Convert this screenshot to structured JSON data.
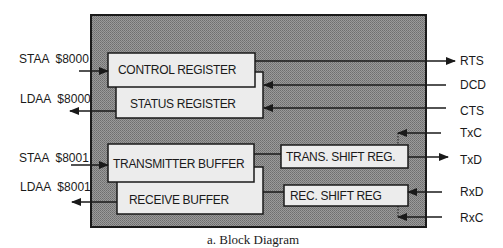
{
  "caption": "a. Block Diagram",
  "colors": {
    "chip_fill": "#8a8a8a",
    "box_fill": "#ececec",
    "line": "#1a1a1a"
  },
  "blocks": {
    "control_register": "CONTROL REGISTER",
    "status_register": "STATUS REGISTER",
    "transmitter_buffer": "TRANSMITTER BUFFER",
    "receive_buffer": "RECEIVE BUFFER",
    "trans_shift_reg": "TRANS. SHIFT REG.",
    "rec_shift_reg": "REC. SHIFT REG"
  },
  "left_signals": {
    "staa_8000": "STAA  $8000",
    "ldaa_8000": "LDAA  $8000",
    "staa_8001": "STAA  $8001",
    "ldaa_8001": "LDAA  $8001"
  },
  "right_signals": {
    "rts": "RTS",
    "dcd": "DCD",
    "cts": "CTS",
    "txc": "TxC",
    "txd": "TxD",
    "rxd": "RxD",
    "rxc": "RxC"
  }
}
